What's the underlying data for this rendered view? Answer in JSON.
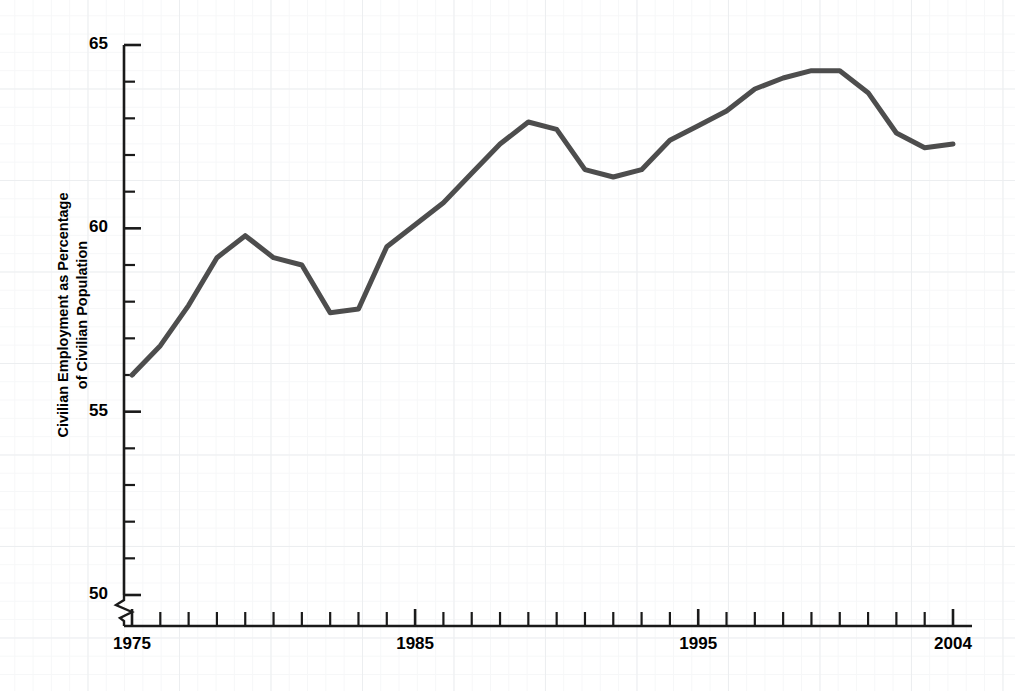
{
  "chart_data": {
    "type": "line",
    "title": "",
    "subtitle": "",
    "xlabel": "",
    "ylabel": "Civilian Employment as Percentage of Civilian Population",
    "ylabel_line1": "Civilian Employment as Percentage",
    "ylabel_line2": "of Civilian Population",
    "xlim": [
      1975,
      2004
    ],
    "ylim": [
      50,
      65
    ],
    "y_axis_break": true,
    "y_axis_break_below": 50,
    "grid": true,
    "grid_style": "graph-paper",
    "legend": "none",
    "legend_position": "none",
    "line_color": "#4d4d4d",
    "line_width": 5,
    "x_major_ticks": [
      1975,
      1985,
      1995,
      2004
    ],
    "x_major_tick_labels": [
      "1975",
      "1985",
      "1995",
      "2004"
    ],
    "x_minor_tick_interval": 1,
    "y_major_ticks": [
      50,
      55,
      60,
      65
    ],
    "y_major_tick_labels": [
      "50",
      "55",
      "60",
      "65"
    ],
    "y_minor_tick_interval": 1,
    "x": [
      1975,
      1976,
      1977,
      1978,
      1979,
      1980,
      1981,
      1982,
      1983,
      1984,
      1985,
      1986,
      1987,
      1988,
      1989,
      1990,
      1991,
      1992,
      1993,
      1994,
      1995,
      1996,
      1997,
      1998,
      1999,
      2000,
      2001,
      2002,
      2003,
      2004
    ],
    "values": [
      56.0,
      56.8,
      57.9,
      59.2,
      59.8,
      59.2,
      59.0,
      57.7,
      57.8,
      59.5,
      60.1,
      60.7,
      61.5,
      62.3,
      62.9,
      62.7,
      61.6,
      61.4,
      61.6,
      62.4,
      62.8,
      63.2,
      63.8,
      64.1,
      64.3,
      64.3,
      63.7,
      62.6,
      62.2,
      62.3
    ],
    "annotations": []
  }
}
